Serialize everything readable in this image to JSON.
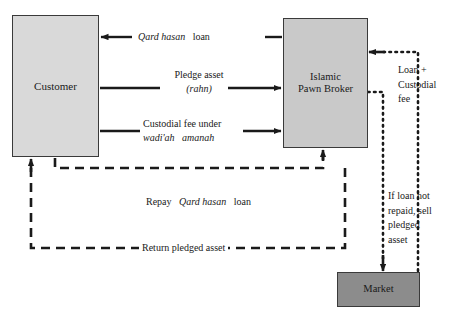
{
  "diagram": {
    "type": "process-flow-diagram",
    "colors": {
      "customer_box": "#d9d9d9",
      "broker_box": "#c9c9c9",
      "market_box": "#8c8c8c",
      "stroke": "#1a1a1a",
      "background": "#ffffff"
    },
    "nodes": [
      {
        "id": "customer",
        "label": "Customer"
      },
      {
        "id": "broker",
        "label": "Islamic\nPawn Broker",
        "line1": "Islamic",
        "line2": "Pawn Broker"
      },
      {
        "id": "market",
        "label": "Market"
      }
    ],
    "flows": [
      {
        "id": "qard-hasan-loan",
        "from": "broker",
        "to": "customer",
        "style": "solid",
        "label_plain_1": "",
        "label_italic": "Qard hasan",
        "label_plain_2": "loan"
      },
      {
        "id": "pledge-asset",
        "from": "customer",
        "to": "broker",
        "style": "solid",
        "label_line1": "Pledge asset",
        "label_italic_line2": "(rahn)"
      },
      {
        "id": "custodial-fee",
        "from": "customer",
        "to": "broker",
        "style": "solid",
        "label_line1": "Custodial fee under",
        "label_italic_a": "wadi'ah",
        "label_italic_b": "amanah"
      },
      {
        "id": "repay-qard-hasan-loan",
        "from": "customer",
        "to": "broker",
        "style": "dashed",
        "label_plain_1": "Repay",
        "label_italic": "Qard hasan",
        "label_plain_2": "loan"
      },
      {
        "id": "return-pledged-asset",
        "from": "broker",
        "to": "customer",
        "style": "dashed",
        "label": "Return pledged asset"
      },
      {
        "id": "sell-pledged-asset",
        "from": "broker",
        "to": "market",
        "style": "dotted",
        "label": "If loan not repaid, sell pledged asset"
      },
      {
        "id": "loan-plus-custodial-fee",
        "from": "market",
        "to": "broker",
        "style": "dotted",
        "label": "Loan + Custodial fee"
      }
    ]
  }
}
